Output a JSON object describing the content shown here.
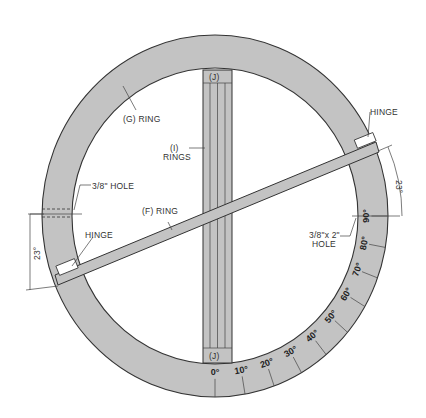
{
  "diagram": {
    "labels": {
      "g_ring": "(G) RING",
      "i_rings_top": "(I)",
      "i_rings_bottom": "RINGS",
      "f_ring": "(F) RING",
      "hole_left": "3/8\" HOLE",
      "hinge_left": "HINGE",
      "hinge_right": "HINGE",
      "hole_right_top": "3/8\"x 2\"",
      "hole_right_bottom": "HOLE",
      "j_top": "(J)",
      "j_bottom": "(J)",
      "angle_left": "23°",
      "angle_right": "23°"
    },
    "scale": {
      "ticks": [
        "0°",
        "10°",
        "20°",
        "30°",
        "40°",
        "50°",
        "60°",
        "70°",
        "80°",
        "90°"
      ]
    },
    "colors": {
      "ring": "#c3c3c3",
      "line": "#333333",
      "background": "#ffffff"
    }
  }
}
